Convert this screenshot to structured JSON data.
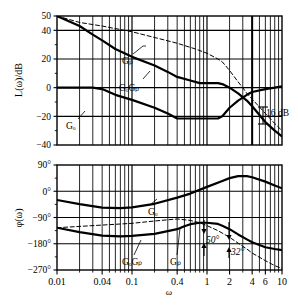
{
  "figure": {
    "caption": "ω",
    "xaxis_title": "ω"
  },
  "magnitude_plot": {
    "ylabel": "L(ω)/dB",
    "yticks": [
      "50",
      "40",
      "20",
      "0",
      "−20",
      "−40"
    ],
    "ytick_values": [
      50,
      40,
      20,
      0,
      -20,
      -40
    ],
    "annotations": [
      {
        "name": "gain-margin",
        "text": "16 dB"
      },
      {
        "name": "curve-label-gp",
        "text": "Gₚ"
      },
      {
        "name": "curve-label-gogp",
        "text": "GₒGₚ"
      },
      {
        "name": "curve-label-go",
        "text": "Gₒ"
      }
    ]
  },
  "phase_plot": {
    "ylabel": "φ(ω)",
    "yticks": [
      "90°",
      "0°",
      "−90°",
      "−180°",
      "−270°"
    ],
    "ytick_values": [
      90,
      0,
      -90,
      -180,
      -270
    ],
    "annotations": [
      {
        "name": "phase-margin-50",
        "text": "50°"
      },
      {
        "name": "phase-margin-32",
        "text": "32°"
      },
      {
        "name": "curve-label-go",
        "text": "Gₒ"
      },
      {
        "name": "curve-label-gogp",
        "text": "GₒGₚ"
      },
      {
        "name": "curve-label-gp",
        "text": "Gₚ"
      }
    ]
  },
  "xaxis": {
    "label": "ω",
    "ticks": [
      "0.01",
      "0.04",
      "0.1",
      "0.4",
      "1",
      "2",
      "4",
      "6",
      "10"
    ],
    "tick_values": [
      0.01,
      0.04,
      0.1,
      0.4,
      1,
      2,
      4,
      6,
      10
    ],
    "range": [
      0.01,
      10
    ],
    "scale": "log"
  },
  "chart_data": {
    "type": "line",
    "title": "",
    "subtitle": "",
    "xlabel": "ω",
    "ylabel": "L(ω)/dB",
    "xscale": "log",
    "xlim": [
      0.01,
      10
    ],
    "grid": true,
    "legend": "inline-labels",
    "panels": [
      {
        "name": "magnitude",
        "ylabel": "L(ω)/dB",
        "ylim": [
          -40,
          50
        ],
        "yticks": [
          -40,
          -20,
          0,
          20,
          40,
          50
        ],
        "series": [
          {
            "name": "GₒGₚ",
            "style": "solid-thick",
            "points": [
              [
                0.01,
                50
              ],
              [
                0.02,
                43
              ],
              [
                0.03,
                37
              ],
              [
                0.04,
                33
              ],
              [
                0.06,
                27
              ],
              [
                0.1,
                21.5
              ],
              [
                0.2,
                15.5
              ],
              [
                0.3,
                11
              ],
              [
                0.4,
                7.5
              ],
              [
                0.6,
                5
              ],
              [
                0.8,
                3.2
              ],
              [
                1.0,
                3.2
              ],
              [
                1.4,
                3.2
              ],
              [
                1.6,
                2.5
              ],
              [
                2.0,
                0
              ],
              [
                2.6,
                -4
              ],
              [
                3.4,
                -9
              ],
              [
                4.0,
                -13
              ],
              [
                6.0,
                -24
              ],
              [
                8.0,
                -30
              ],
              [
                10.0,
                -34
              ]
            ]
          },
          {
            "name": "Gₚ",
            "style": "dashed",
            "points": [
              [
                0.01,
                50
              ],
              [
                0.02,
                45.5
              ],
              [
                0.04,
                43
              ],
              [
                0.1,
                39
              ],
              [
                0.2,
                35
              ],
              [
                0.4,
                31
              ],
              [
                0.7,
                27
              ],
              [
                1.0,
                24
              ],
              [
                1.4,
                20
              ],
              [
                1.6,
                18
              ],
              [
                2.0,
                12
              ],
              [
                2.6,
                4
              ],
              [
                3.0,
                0
              ],
              [
                3.4,
                -4
              ],
              [
                4.0,
                -8
              ],
              [
                6.0,
                -18
              ],
              [
                8.0,
                -25
              ],
              [
                10.0,
                -30
              ]
            ]
          },
          {
            "name": "Gₒ",
            "style": "solid-thick",
            "points": [
              [
                0.01,
                0
              ],
              [
                0.02,
                0
              ],
              [
                0.03,
                0
              ],
              [
                0.04,
                -1
              ],
              [
                0.06,
                -5
              ],
              [
                0.1,
                -8.5
              ],
              [
                0.2,
                -14
              ],
              [
                0.3,
                -18
              ],
              [
                0.4,
                -21.5
              ],
              [
                0.6,
                -21.5
              ],
              [
                0.8,
                -21.5
              ],
              [
                1.0,
                -21.5
              ],
              [
                1.4,
                -21.5
              ],
              [
                1.6,
                -20
              ],
              [
                2.0,
                -14
              ],
              [
                2.6,
                -9
              ],
              [
                3.4,
                -5
              ],
              [
                4.0,
                -3
              ],
              [
                6.0,
                -1
              ],
              [
                8.0,
                0
              ],
              [
                10.0,
                1
              ]
            ]
          }
        ],
        "markers": [
          {
            "name": "gain-margin",
            "label": "16 dB",
            "x": 4.0,
            "y_from": 0,
            "y_to": -16
          }
        ]
      },
      {
        "name": "phase",
        "ylabel": "φ(ω)",
        "ylim": [
          -270,
          90
        ],
        "yticks": [
          -270,
          -180,
          -90,
          0,
          90
        ],
        "series": [
          {
            "name": "Gₒ",
            "style": "solid-thick",
            "points": [
              [
                0.01,
                -30
              ],
              [
                0.02,
                -44
              ],
              [
                0.04,
                -56
              ],
              [
                0.07,
                -58
              ],
              [
                0.1,
                -55
              ],
              [
                0.2,
                -43
              ],
              [
                0.4,
                -22
              ],
              [
                0.6,
                -8
              ],
              [
                1.0,
                15
              ],
              [
                1.6,
                35
              ],
              [
                2.0,
                45
              ],
              [
                2.6,
                52
              ],
              [
                3.4,
                52
              ],
              [
                4.0,
                48
              ],
              [
                6.0,
                33
              ],
              [
                8.0,
                20
              ],
              [
                10.0,
                10
              ]
            ]
          },
          {
            "name": "GₒGₚ",
            "style": "solid-thick",
            "points": [
              [
                0.01,
                -125
              ],
              [
                0.02,
                -140
              ],
              [
                0.04,
                -152
              ],
              [
                0.07,
                -155
              ],
              [
                0.1,
                -153
              ],
              [
                0.2,
                -146
              ],
              [
                0.4,
                -130
              ],
              [
                0.5,
                -120
              ],
              [
                0.6,
                -113
              ],
              [
                0.8,
                -108
              ],
              [
                1.0,
                -108
              ],
              [
                1.4,
                -112
              ],
              [
                1.6,
                -118
              ],
              [
                2.0,
                -130
              ],
              [
                2.6,
                -148
              ],
              [
                3.4,
                -165
              ],
              [
                4.0,
                -175
              ],
              [
                6.0,
                -192
              ],
              [
                8.0,
                -198
              ],
              [
                10.0,
                -202
              ]
            ]
          },
          {
            "name": "Gₚ",
            "style": "dashed",
            "points": [
              [
                0.01,
                -125
              ],
              [
                0.1,
                -110
              ],
              [
                0.2,
                -102
              ],
              [
                0.4,
                -95
              ],
              [
                0.6,
                -100
              ],
              [
                0.8,
                -108
              ],
              [
                1.0,
                -118
              ],
              [
                1.4,
                -135
              ],
              [
                2.0,
                -158
              ],
              [
                2.6,
                -178
              ],
              [
                3.4,
                -198
              ],
              [
                4.0,
                -212
              ],
              [
                6.0,
                -238
              ],
              [
                8.0,
                -255
              ],
              [
                10.0,
                -265
              ]
            ]
          }
        ],
        "markers": [
          {
            "name": "phase-margin-50",
            "label": "50°",
            "x": 1.5,
            "y_from": -180,
            "y_to": -130
          },
          {
            "name": "phase-margin-32",
            "label": "32°",
            "x": 2.6,
            "y_from": -180,
            "y_to": -148
          }
        ]
      }
    ]
  }
}
